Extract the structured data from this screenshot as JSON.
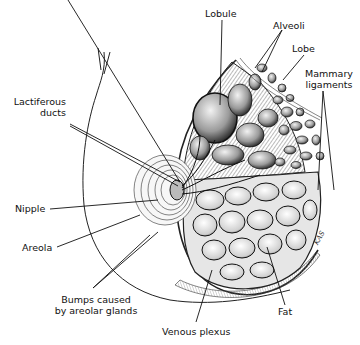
{
  "diagram": {
    "labels": {
      "lobule": "Lobule",
      "alveoli": "Alveoli",
      "lobe": "Lobe",
      "mammary_ligaments_line1": "Mammary",
      "mammary_ligaments_line2": "ligaments",
      "lactiferous_ducts_line1": "Lactiferous",
      "lactiferous_ducts_line2": "ducts",
      "nipple": "Nipple",
      "areola": "Areola",
      "bumps_line1": "Bumps caused",
      "bumps_line2": "by areolar glands",
      "venous_plexus": "Venous plexus",
      "fat": "Fat"
    },
    "artist_signature": "KAS",
    "colors": {
      "ink": "#111111",
      "background": "#ffffff",
      "shade_dark": "#3a3a3a",
      "shade_mid": "#8a8a8a",
      "shade_light": "#d6d6d6"
    }
  }
}
